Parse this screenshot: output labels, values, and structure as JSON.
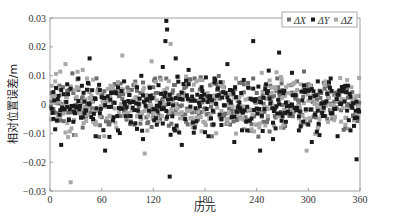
{
  "chart_data": {
    "type": "scatter",
    "title": "",
    "xlabel": "历元",
    "ylabel": "相对位置误差/m",
    "xlim": [
      0,
      360
    ],
    "ylim": [
      -0.03,
      0.03
    ],
    "xticks": [
      0,
      60,
      120,
      180,
      240,
      300,
      360
    ],
    "yticks": [
      -0.03,
      -0.02,
      -0.01,
      0,
      0.01,
      0.02,
      0.03
    ],
    "xtick_labels": [
      "0",
      "60",
      "120",
      "180",
      "240",
      "300",
      "360"
    ],
    "ytick_labels": [
      "-0.03",
      "-0.02",
      "-0.01",
      "0",
      "0.01",
      "0.02",
      "0.03"
    ],
    "grid": false,
    "legend_position": "upper right",
    "series": [
      {
        "name": "ΔX",
        "color": "#6e6e6e",
        "x": [
          2,
          8,
          15,
          22,
          30,
          38,
          45,
          52,
          60,
          68,
          75,
          82,
          90,
          98,
          105,
          112,
          120,
          128,
          135,
          142,
          150,
          158,
          165,
          172,
          180,
          188,
          195,
          202,
          210,
          218,
          225,
          232,
          240,
          248,
          255,
          262,
          270,
          278,
          285,
          292,
          300,
          308,
          315,
          322,
          330,
          338,
          345,
          352,
          358
        ],
        "values": [
          0.004,
          -0.003,
          0.006,
          -0.005,
          0.002,
          -0.008,
          0.005,
          -0.002,
          0.003,
          -0.006,
          0.007,
          -0.004,
          0.001,
          -0.007,
          0.004,
          -0.001,
          0.006,
          -0.005,
          0.009,
          -0.003,
          0.002,
          -0.006,
          0.005,
          -0.002,
          0.003,
          -0.007,
          0.006,
          -0.004,
          0.001,
          -0.005,
          0.007,
          -0.002,
          0.004,
          -0.006,
          0.003,
          -0.001,
          0.005,
          -0.004,
          0.002,
          -0.007,
          0.006,
          -0.003,
          0.004,
          -0.005,
          0.001,
          -0.002,
          0.005,
          -0.004,
          0.003
        ]
      },
      {
        "name": "ΔY",
        "color": "#1a1a1a",
        "x": [
          4,
          10,
          13,
          20,
          27,
          33,
          40,
          46,
          53,
          58,
          64,
          71,
          79,
          86,
          93,
          101,
          108,
          116,
          124,
          131,
          134,
          135,
          136,
          139,
          146,
          153,
          161,
          168,
          176,
          184,
          191,
          199,
          206,
          214,
          222,
          229,
          236,
          244,
          251,
          259,
          266,
          274,
          281,
          289,
          296,
          304,
          311,
          319,
          326,
          334,
          341,
          349,
          356
        ],
        "values": [
          -0.005,
          0.003,
          -0.014,
          0.007,
          -0.006,
          0.009,
          -0.003,
          0.016,
          -0.011,
          0.005,
          -0.016,
          0.004,
          -0.009,
          0.008,
          -0.004,
          0.006,
          -0.012,
          0.003,
          -0.007,
          0.013,
          0.022,
          0.029,
          0.026,
          -0.025,
          0.016,
          -0.014,
          0.012,
          -0.008,
          0.006,
          -0.011,
          0.009,
          -0.005,
          0.014,
          -0.013,
          0.004,
          -0.009,
          0.022,
          -0.016,
          0.007,
          -0.012,
          0.018,
          -0.006,
          0.011,
          -0.009,
          0.005,
          -0.013,
          0.008,
          -0.004,
          0.009,
          -0.011,
          0.006,
          -0.009,
          -0.019
        ]
      },
      {
        "name": "ΔZ",
        "color": "#a8a8a8",
        "x": [
          6,
          12,
          18,
          24,
          31,
          36,
          43,
          50,
          56,
          63,
          70,
          77,
          84,
          91,
          99,
          106,
          110,
          118,
          126,
          133,
          140,
          148,
          155,
          163,
          170,
          178,
          186,
          193,
          201,
          208,
          216,
          224,
          231,
          239,
          246,
          253,
          261,
          268,
          276,
          283,
          291,
          298,
          305,
          313,
          320,
          328,
          336,
          343,
          350,
          357
        ],
        "values": [
          0.008,
          -0.004,
          0.014,
          -0.027,
          0.006,
          -0.002,
          0.009,
          -0.006,
          0.004,
          -0.011,
          0.003,
          -0.008,
          0.017,
          -0.003,
          0.007,
          -0.005,
          -0.017,
          0.015,
          -0.006,
          0.005,
          0.021,
          -0.009,
          0.004,
          -0.002,
          0.008,
          -0.006,
          0.003,
          -0.01,
          0.006,
          -0.003,
          0.009,
          -0.005,
          0.002,
          -0.007,
          0.011,
          -0.004,
          0.006,
          -0.008,
          0.004,
          -0.002,
          0.007,
          -0.016,
          0.003,
          -0.005,
          0.008,
          -0.004,
          0.005,
          -0.007,
          0.006,
          -0.003
        ]
      }
    ]
  },
  "legend": {
    "items": [
      {
        "label": "ΔX",
        "color": "#6e6e6e"
      },
      {
        "label": "ΔY",
        "color": "#1a1a1a"
      },
      {
        "label": "ΔZ",
        "color": "#a8a8a8"
      }
    ]
  },
  "axes": {
    "xlabel": "历元",
    "ylabel": "相对位置误差/m"
  }
}
